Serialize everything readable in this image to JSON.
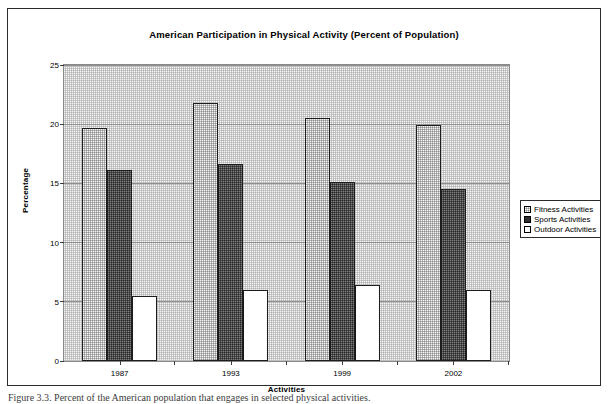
{
  "chart_data": {
    "type": "bar",
    "title": "American Participation in Physical Activity (Percent of Population)",
    "xlabel": "Activities",
    "ylabel": "Percentage",
    "categories": [
      "1987",
      "1993",
      "1999",
      "2002"
    ],
    "series": [
      {
        "name": "Fitness Activities",
        "values": [
          19.7,
          21.8,
          20.5,
          19.9
        ],
        "pattern": "stippled-light-grey"
      },
      {
        "name": "Sports Activities",
        "values": [
          16.1,
          16.6,
          15.1,
          14.5
        ],
        "pattern": "solid-dark-grey"
      },
      {
        "name": "Outdoor Activities",
        "values": [
          5.5,
          6.0,
          6.4,
          6.0
        ],
        "pattern": "white"
      }
    ],
    "ylim": [
      0,
      25
    ],
    "yticks": [
      0,
      5,
      10,
      15,
      20,
      25
    ],
    "grid": true,
    "legend_position": "right"
  },
  "legend": {
    "items": [
      {
        "label": "Fitness Activities"
      },
      {
        "label": "Sports Activities"
      },
      {
        "label": "Outdoor Activities"
      }
    ]
  },
  "caption": "Figure 3.3. Percent of the American population that engages in selected physical activities."
}
